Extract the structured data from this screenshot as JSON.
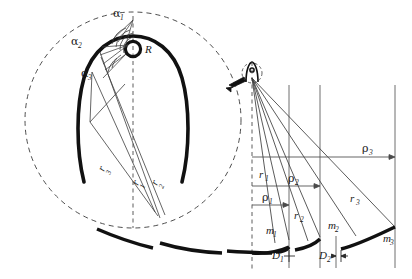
{
  "figure": {
    "title": "",
    "background_color": "#ffffff",
    "ink_color": "#1a1a1a",
    "thin_line_color": "#5a5a5a",
    "width": 412,
    "height": 279
  },
  "detail_view": {
    "name": "magnified-detail-circle",
    "center_x": 133,
    "center_y": 120,
    "radius": 108,
    "boundary_style": "dashed",
    "labels": {
      "alpha1": "α1",
      "alpha1_base": "α",
      "alpha1_sub": "1",
      "alpha2_base": "α",
      "alpha2_sub": "2",
      "alpha3_base": "α",
      "alpha3_sub": "3",
      "R": "R",
      "r1_base": "r",
      "r1_sub": "1",
      "r2_base": "r",
      "r2_sub": "2",
      "r3_base": "r",
      "r3_sub": "3"
    }
  },
  "source_detail": {
    "name": "source-point-circle",
    "center_x": 252,
    "center_y": 73,
    "radius": 10,
    "boundary_style": "dashed"
  },
  "callout_arrow": {
    "name": "magnify-callout-arrow",
    "from_x": 244,
    "from_y": 78,
    "to_x": 226,
    "to_y": 87
  },
  "right_view": {
    "name": "ray-geometry-diagram",
    "axis_x": 252,
    "verticals": [
      {
        "label": "v1",
        "x": 289
      },
      {
        "label": "v2",
        "x": 320
      },
      {
        "label": "v3",
        "x": 395
      }
    ],
    "dimensions": [
      {
        "name": "rho1",
        "base": "ρ",
        "sub": "1",
        "y": 205,
        "x_start": 252,
        "x_end": 289,
        "label_x": 263,
        "label_y": 199
      },
      {
        "name": "rho2",
        "base": "ρ",
        "sub": "2",
        "y": 186,
        "x_start": 252,
        "x_end": 320,
        "label_x": 289,
        "label_y": 180
      },
      {
        "name": "rho3",
        "base": "ρ",
        "sub": "3",
        "y": 157,
        "x_start": 252,
        "x_end": 395,
        "label_x": 363,
        "label_y": 150
      }
    ],
    "rays": [
      {
        "name": "r1",
        "base": "r",
        "sub": "1",
        "end_x": 289,
        "end_y": 240,
        "label_x": 261,
        "label_y": 176
      },
      {
        "name": "r2",
        "base": "r",
        "sub": "2",
        "end_x": 320,
        "end_y": 236,
        "label_x": 297,
        "label_y": 218
      },
      {
        "name": "r3",
        "base": "r",
        "sub": "3",
        "end_x": 395,
        "end_y": 226,
        "label_x": 352,
        "label_y": 200
      }
    ],
    "mirror_segments": [
      {
        "name": "m1",
        "base": "m",
        "sub": "1",
        "label_x": 268,
        "label_y": 233
      },
      {
        "name": "m2",
        "base": "m",
        "sub": "2",
        "label_x": 330,
        "label_y": 228
      },
      {
        "name": "m3",
        "base": "m",
        "sub": "3",
        "label_x": 385,
        "label_y": 240
      }
    ],
    "gaps": [
      {
        "name": "D1",
        "base": "D",
        "sub": "1",
        "label_x": 276,
        "label_y": 256,
        "tick_x": 289
      },
      {
        "name": "D2",
        "base": "D",
        "sub": "2",
        "label_x": 323,
        "label_y": 256,
        "tick_x": 336
      }
    ]
  },
  "bottom_arcs": {
    "name": "segmented-mirror-array",
    "count": 6,
    "description": "segmented curved mirror strip"
  }
}
